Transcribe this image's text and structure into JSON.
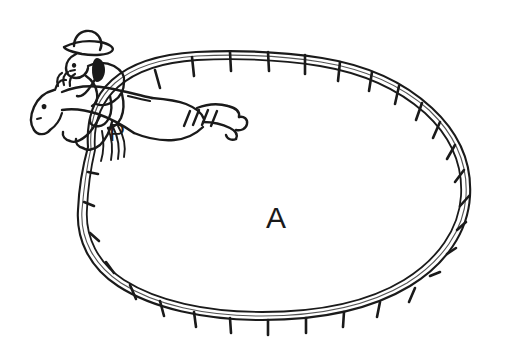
{
  "figure": {
    "kind": "hand-drawn-sketch",
    "background_color": "#ffffff",
    "ink_color": "#1a1a1a",
    "width": 514,
    "height": 350
  },
  "labels": [
    {
      "id": "region-label-a",
      "text": "A",
      "meaning": "enclosed region inside the fence",
      "x": 276,
      "y": 228,
      "font_size": 30
    },
    {
      "id": "point-label-p",
      "text": "P",
      "meaning": "point on the fence where the horse crosses",
      "x": 117,
      "y": 141,
      "font_size": 24
    }
  ],
  "elements": {
    "fence": {
      "name": "fence-loop",
      "shape": "closed oval corral",
      "rails": 2,
      "post_count": 28,
      "stroke_color": "#1a1a1a"
    },
    "horse": {
      "name": "horse",
      "pose": "leaping",
      "facing": "left",
      "features": [
        "head",
        "mane",
        "ears",
        "eye",
        "front legs",
        "hind legs",
        "tail"
      ]
    },
    "rider": {
      "name": "cowboy-rider",
      "features": [
        "cowboy hat",
        "head",
        "arm",
        "torso",
        "leg",
        "boot"
      ]
    },
    "motion_lines": {
      "name": "motion-lines",
      "count": 4,
      "meaning": "speed lines indicating fast movement"
    }
  }
}
